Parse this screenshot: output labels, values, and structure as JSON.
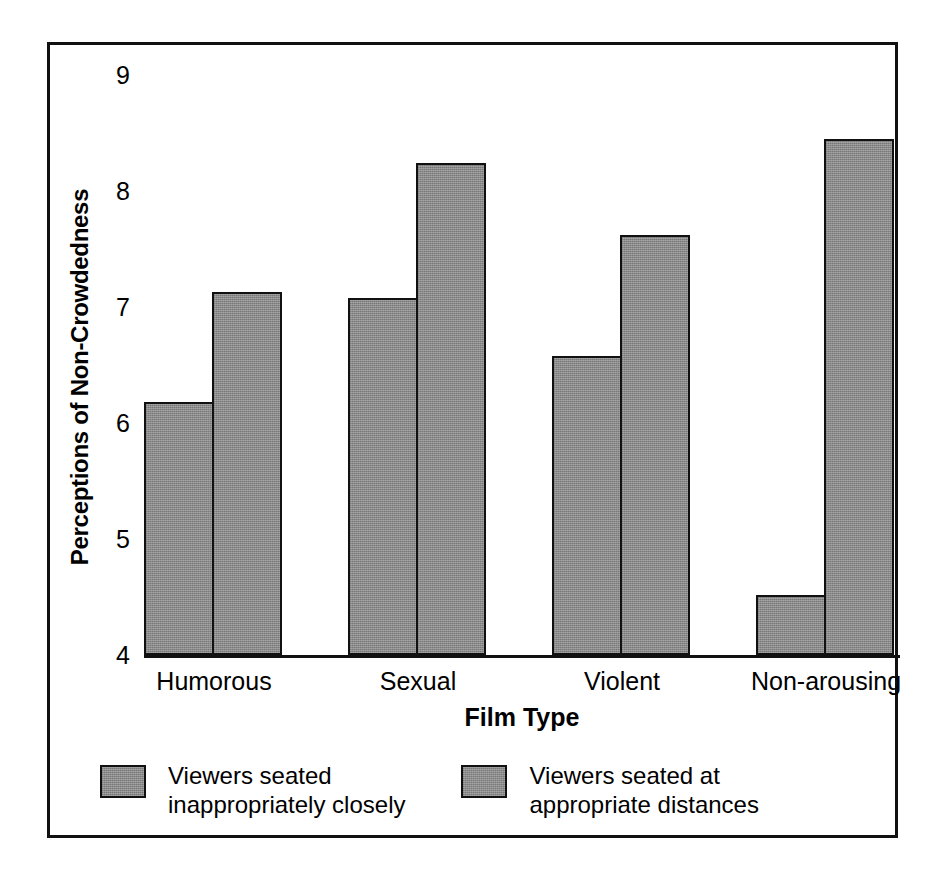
{
  "chart_data": {
    "type": "bar",
    "title": "",
    "xlabel": "Film Type",
    "ylabel": "Perceptions of Non-Crowdedness",
    "categories": [
      "Humorous",
      "Sexual",
      "Violent",
      "Non-arousing"
    ],
    "ylim": [
      4,
      9
    ],
    "yticks": [
      9,
      8,
      7,
      6,
      5,
      4
    ],
    "grid": false,
    "legend_position": "bottom",
    "bar_color": "#8a8a8a",
    "bar_edge_color": "#111111",
    "series": [
      {
        "name": "Viewers seated\ninappropriately closely",
        "values": [
          6.18,
          7.08,
          6.58,
          4.52
        ]
      },
      {
        "name": "Viewers seated at\nappropriate distances",
        "values": [
          7.13,
          8.24,
          7.62,
          8.45
        ]
      }
    ]
  },
  "axes": {
    "y_ticks": [
      "9",
      "8",
      "7",
      "6",
      "5",
      "4"
    ],
    "x_ticks": [
      "Humorous",
      "Sexual",
      "Violent",
      "Non-arousing"
    ],
    "y_title": "Perceptions of Non-Crowdedness",
    "x_title": "Film Type"
  },
  "legend": {
    "entries": [
      {
        "label": "Viewers seated\ninappropriately closely",
        "swatch": "gray-hatched-swatch"
      },
      {
        "label": "Viewers seated at\nappropriate distances",
        "swatch": "gray-hatched-swatch"
      }
    ]
  },
  "artifact": {
    "top_text": ""
  }
}
